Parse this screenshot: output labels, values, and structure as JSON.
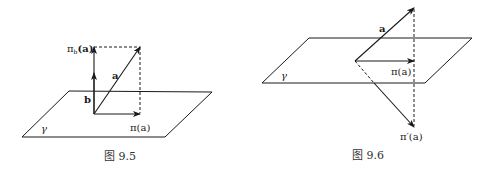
{
  "figures": [
    {
      "caption": "图 9.5",
      "labels": {
        "proj_b": "π",
        "proj_b_sub": "b",
        "proj_b_arg": "(a)",
        "vec_a": "a",
        "vec_b": "b",
        "proj": "π(a)",
        "plane": "γ"
      }
    },
    {
      "caption": "图 9.6",
      "labels": {
        "vec_a": "a",
        "proj": "π(a)",
        "proj_prime": "π′(a)",
        "plane": "γ"
      }
    }
  ],
  "colors": {
    "stroke": "#1a1a1a",
    "background": "#ffffff"
  }
}
